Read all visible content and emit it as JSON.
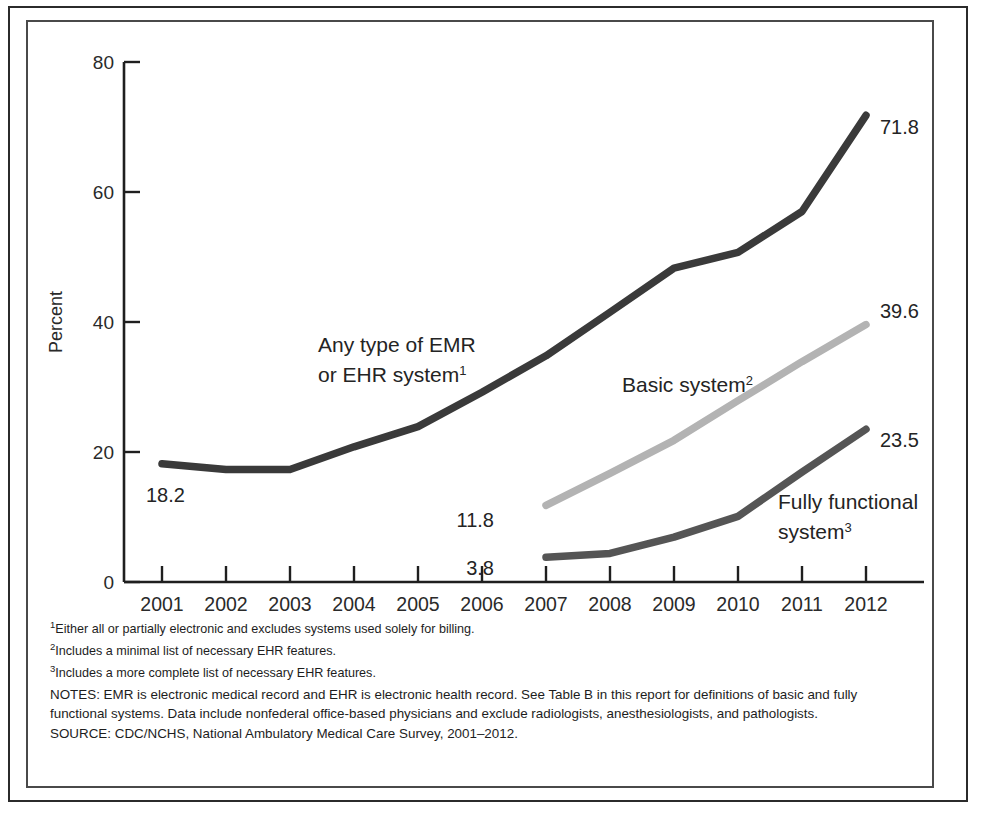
{
  "figure": {
    "y_axis_title": "Percent",
    "y_ticks": [
      "0",
      "20",
      "40",
      "60",
      "80"
    ],
    "x_ticks": [
      "2001",
      "2002",
      "2003",
      "2004",
      "2005",
      "2006",
      "2007",
      "2008",
      "2009",
      "2010",
      "2011",
      "2012"
    ],
    "series_labels": {
      "emr_line1": "Any type of EMR",
      "emr_line2": "or EHR system",
      "emr_footnote_marker": "1",
      "basic": "Basic system",
      "basic_footnote_marker": "2",
      "fully_line1": "Fully functional",
      "fully_line2": "system",
      "fully_footnote_marker": "3"
    },
    "value_labels": {
      "emr_start": "18.2",
      "emr_end": "71.8",
      "basic_start": "11.8",
      "basic_end": "39.6",
      "fully_start": "3.8",
      "fully_end": "23.5"
    },
    "colors": {
      "emr": "#3a3a3a",
      "basic": "#b3b3b3",
      "fully": "#555555",
      "axis": "#1f1f1f",
      "frame_outer": "#2b2b2b",
      "frame_inner": "#4a4a4a"
    }
  },
  "notes": {
    "footnote1": "Either all or partially electronic and excludes systems used solely for billing.",
    "footnote1_marker": "1",
    "footnote2": "Includes a minimal list of necessary EHR features.",
    "footnote2_marker": "2",
    "footnote3": "Includes a more complete list of necessary EHR features.",
    "footnote3_marker": "3",
    "notes_paragraph": "NOTES: EMR is electronic medical record and EHR is electronic health record. See Table B in this report for definitions of basic and fully functional systems. Data include nonfederal office-based physicians and exclude radiologists, anesthesiologists, and pathologists.",
    "source": "SOURCE: CDC/NCHS, National Ambulatory Medical Care Survey, 2001–2012."
  },
  "chart_data": {
    "type": "line",
    "title": "",
    "xlabel": "",
    "ylabel": "Percent",
    "xlim": [
      2001,
      2012
    ],
    "ylim": [
      0,
      80
    ],
    "yticks": [
      0,
      20,
      40,
      60,
      80
    ],
    "xticks": [
      2001,
      2002,
      2003,
      2004,
      2005,
      2006,
      2007,
      2008,
      2009,
      2010,
      2011,
      2012
    ],
    "grid": false,
    "legend": "inline-annotations",
    "series": [
      {
        "name": "Any type of EMR or EHR system",
        "color": "#3a3a3a",
        "x": [
          2001,
          2002,
          2003,
          2004,
          2005,
          2006,
          2007,
          2008,
          2009,
          2010,
          2011,
          2012
        ],
        "values": [
          18.2,
          17.3,
          17.3,
          20.8,
          23.9,
          29.2,
          34.8,
          41.5,
          48.3,
          50.7,
          57.0,
          71.8
        ],
        "start_label": "18.2",
        "end_label": "71.8"
      },
      {
        "name": "Basic system",
        "color": "#b3b3b3",
        "x": [
          2007,
          2008,
          2009,
          2010,
          2011,
          2012
        ],
        "values": [
          11.8,
          16.7,
          21.8,
          27.9,
          33.9,
          39.6
        ],
        "start_label": "11.8",
        "end_label": "39.6"
      },
      {
        "name": "Fully functional system",
        "color": "#555555",
        "x": [
          2007,
          2008,
          2009,
          2010,
          2011,
          2012
        ],
        "values": [
          3.8,
          4.4,
          6.9,
          10.1,
          16.9,
          23.5
        ],
        "start_label": "3.8",
        "end_label": "23.5"
      }
    ]
  }
}
